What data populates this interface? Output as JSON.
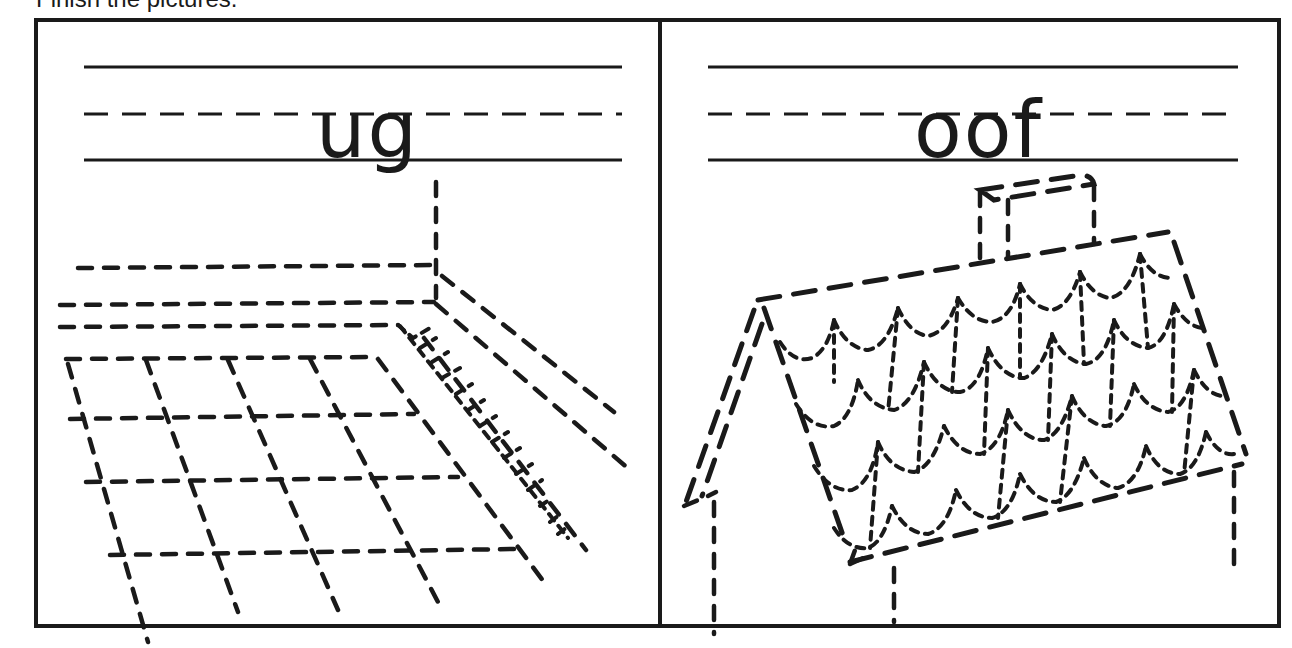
{
  "worksheet": {
    "instruction": "Finish the pictures.",
    "colors": {
      "ink": "#1a1a1a",
      "paper": "#ffffff"
    },
    "panels": [
      {
        "id": "rug",
        "word_fragment": "ug",
        "picture": "rug",
        "picture_icon": "rug-tracing-icon",
        "guide_lines": [
          "top-solid",
          "middle-dashed",
          "baseline-solid"
        ]
      },
      {
        "id": "roof",
        "word_fragment": "oof",
        "picture": "roof",
        "picture_icon": "roof-tracing-icon",
        "guide_lines": [
          "top-solid",
          "middle-dashed",
          "baseline-solid"
        ]
      }
    ]
  }
}
